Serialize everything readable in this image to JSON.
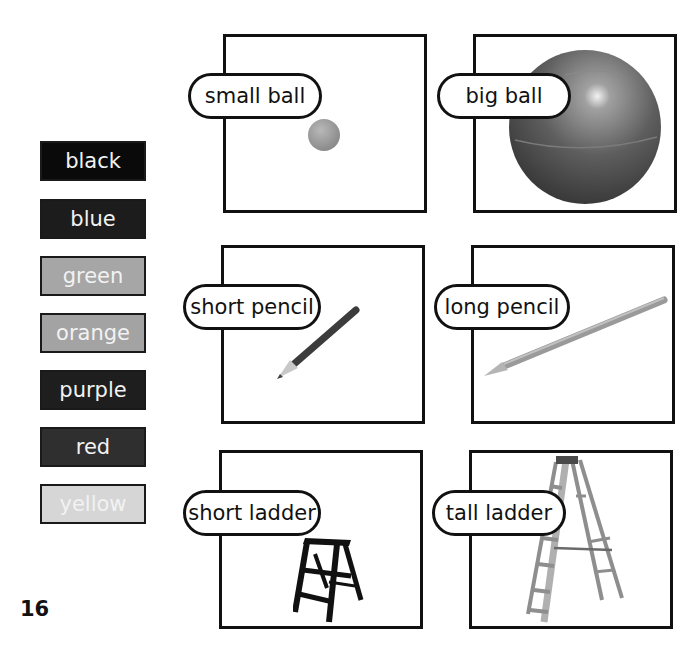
{
  "page_number": "16",
  "color_words": [
    {
      "label": "black",
      "swatch_color": "#0a0a0a"
    },
    {
      "label": "blue",
      "swatch_color": "#1c1c1c"
    },
    {
      "label": "green",
      "swatch_color": "#a6a6a6"
    },
    {
      "label": "orange",
      "swatch_color": "#a3a3a3"
    },
    {
      "label": "purple",
      "swatch_color": "#1e1e1e"
    },
    {
      "label": "red",
      "swatch_color": "#2f2f2f"
    },
    {
      "label": "yellow",
      "swatch_color": "#d6d6d6"
    }
  ],
  "cards": [
    {
      "label": "small ball",
      "picture": "small-ball"
    },
    {
      "label": "big ball",
      "picture": "big-ball"
    },
    {
      "label": "short pencil",
      "picture": "short-pencil"
    },
    {
      "label": "long pencil",
      "picture": "long-pencil"
    },
    {
      "label": "short ladder",
      "picture": "short-ladder"
    },
    {
      "label": "tall ladder",
      "picture": "tall-ladder"
    }
  ]
}
